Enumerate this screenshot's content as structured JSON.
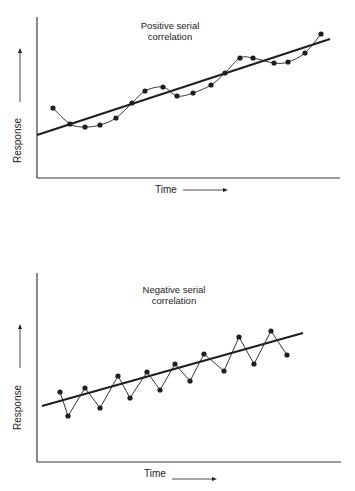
{
  "colors": {
    "ink": "#1f1f1f",
    "axis": "#3a3a3a",
    "background": "#ffffff"
  },
  "chart_data": [
    {
      "type": "line",
      "title": "Positive serial correlation",
      "title_lines": [
        "Positive serial",
        "correlation"
      ],
      "xlabel": "Time",
      "ylabel": "Response",
      "xlabel_arrow": "→",
      "ylabel_arrow": "↑",
      "grid": false,
      "legend": null,
      "axis_ticks": "none",
      "description": "Residuals wander smoothly above and below the fitted straight trend line in long runs",
      "series": [
        {
          "name": "observations",
          "style": "points-with-smooth-curve",
          "x": [
            1,
            2,
            3,
            4,
            5,
            6,
            7,
            8,
            9,
            10,
            11,
            12,
            13,
            14,
            15,
            16,
            17,
            18
          ],
          "y": [
            7.0,
            5.4,
            5.1,
            5.3,
            6.0,
            7.5,
            8.7,
            9.1,
            8.2,
            8.5,
            9.3,
            10.5,
            12.0,
            12.0,
            11.5,
            11.6,
            12.5,
            14.4
          ]
        },
        {
          "name": "trend line",
          "style": "straight-line",
          "x": [
            0,
            18.6
          ],
          "y": [
            4.3,
            13.9
          ]
        }
      ],
      "pixel_points": [
        [
          53,
          108
        ],
        [
          70,
          124
        ],
        [
          85,
          127
        ],
        [
          100,
          125
        ],
        [
          116,
          118
        ],
        [
          132,
          103
        ],
        [
          145,
          91
        ],
        [
          163,
          87
        ],
        [
          177,
          96
        ],
        [
          193,
          93
        ],
        [
          211,
          85
        ],
        [
          225,
          73
        ],
        [
          240,
          58
        ],
        [
          253,
          58
        ],
        [
          274,
          63
        ],
        [
          288,
          62
        ],
        [
          305,
          53
        ],
        [
          321,
          34
        ]
      ],
      "pixel_trend": [
        [
          37,
          135
        ],
        [
          330,
          39
        ]
      ],
      "pixel_axes": {
        "x0": 37,
        "y_top": 17,
        "y_bottom": 178,
        "x_right": 340
      }
    },
    {
      "type": "line",
      "title": "Negative serial correlation",
      "title_lines": [
        "Negative serial",
        "correlation"
      ],
      "xlabel": "Time",
      "ylabel": "Response",
      "xlabel_arrow": "→",
      "ylabel_arrow": "↑",
      "grid": false,
      "legend": null,
      "axis_ticks": "none",
      "description": "Residuals alternate sign from one observation to the next, zig-zagging across the fitted straight trend line",
      "series": [
        {
          "name": "observations",
          "style": "points-with-zigzag",
          "x": [
            1,
            2,
            3,
            4,
            5,
            6,
            7,
            8,
            9,
            10,
            11,
            12,
            13,
            14,
            15,
            16
          ],
          "y": [
            7.0,
            4.6,
            7.4,
            5.4,
            8.6,
            6.4,
            9.0,
            7.2,
            9.8,
            8.1,
            10.8,
            9.1,
            12.5,
            9.8,
            13.1,
            10.7
          ]
        },
        {
          "name": "trend line",
          "style": "straight-line",
          "x": [
            0,
            16.4
          ],
          "y": [
            5.6,
            12.9
          ]
        }
      ],
      "pixel_points": [
        [
          60,
          392
        ],
        [
          68,
          416
        ],
        [
          85,
          388
        ],
        [
          100,
          408
        ],
        [
          118,
          376
        ],
        [
          130,
          398
        ],
        [
          147,
          372
        ],
        [
          160,
          390
        ],
        [
          175,
          364
        ],
        [
          190,
          381
        ],
        [
          204,
          354
        ],
        [
          224,
          371
        ],
        [
          239,
          337
        ],
        [
          254,
          364
        ],
        [
          271,
          331
        ],
        [
          287,
          355
        ]
      ],
      "pixel_trend": [
        [
          42,
          406
        ],
        [
          303,
          333
        ]
      ],
      "pixel_axes": {
        "x0": 37,
        "y_top": 273,
        "y_bottom": 462,
        "x_right": 341
      }
    }
  ]
}
